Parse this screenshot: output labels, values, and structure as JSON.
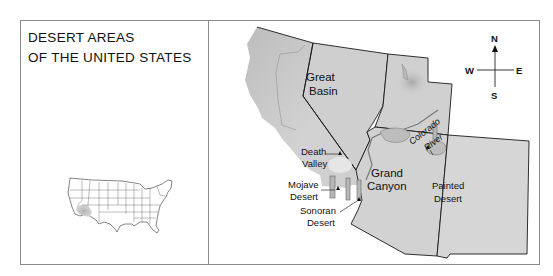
{
  "title": {
    "line1": "DESERT AREAS",
    "line2": "OF THE UNITED STATES"
  },
  "inset_map": {
    "description": "Outline map of the contiguous United States with the southwestern desert region shaded",
    "highlight_color": "#bdbdbd"
  },
  "main_map": {
    "regions": {
      "great_basin": [
        "Great",
        "Basin"
      ],
      "death_valley": [
        "Death",
        "Valley"
      ],
      "mojave_desert": [
        "Mojave",
        "Desert"
      ],
      "sonoran_desert": [
        "Sonoran",
        "Desert"
      ],
      "grand_canyon": [
        "Grand",
        "Canyon"
      ],
      "painted_desert": [
        "Painted",
        "Desert"
      ],
      "colorado_river": [
        "Colorado",
        "River"
      ]
    },
    "land_color": "#c9c9c9",
    "border_color": "#1a1a1a"
  },
  "compass": {
    "north": "N",
    "south": "S",
    "east": "E",
    "west": "W"
  }
}
